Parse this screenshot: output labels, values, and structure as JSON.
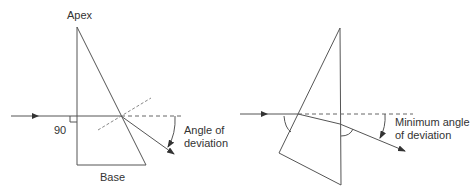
{
  "left_diagram": {
    "labels": {
      "apex": "Apex",
      "base": "Base",
      "right_angle": "90",
      "angle_line1": "Angle of",
      "angle_line2": "deviation"
    }
  },
  "right_diagram": {
    "labels": {
      "angle_line1": "Minimum angle",
      "angle_line2": "of deviation"
    }
  },
  "colors": {
    "line": "#555555",
    "dash": "#777777",
    "text": "#333333"
  }
}
